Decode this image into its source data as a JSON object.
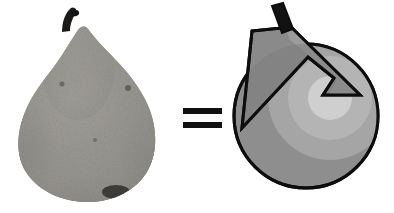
{
  "figure": {
    "title": "Pear equals geometric primitive decomposition",
    "background_color": "#ffffff",
    "width": 394,
    "height": 213
  },
  "panels": [
    {
      "id": "pear-photo",
      "role": "left-operand",
      "label": "Grayscale photograph of a pear",
      "subject": "pear",
      "rendering": "photographic-grayscale",
      "bounds": {
        "x": 0,
        "y": 0,
        "width": 175,
        "height": 213
      }
    },
    {
      "id": "equals-operator",
      "role": "operator",
      "label": "=",
      "glyph_name": "equals-sign",
      "bounds": {
        "x": 175,
        "y": 0,
        "width": 55,
        "height": 213
      }
    },
    {
      "id": "shape-decomposition",
      "role": "right-operand",
      "label": "Abstract shape decomposition of a pear",
      "rendering": "flat-vector-grayscale",
      "bounds": {
        "x": 230,
        "y": 0,
        "width": 164,
        "height": 213
      }
    }
  ],
  "colors": {
    "outline": "#0d0d0d",
    "stem_fill": "#121212",
    "body_mid_gray": "#8e8e8e",
    "body_dark_gray": "#7c7c7c",
    "body_light_gray": "#a5a5a5",
    "ring_light_gray": "#b4b4b4",
    "inner_circle_gray": "#cfcfcf",
    "triangle_gray": "#8a8a8a",
    "triangle_light_gray": "#9a9a9a",
    "pear_skin_mid": "#8f8d88",
    "pear_skin_light": "#b9b7b0",
    "pear_skin_dark": "#5d5b57",
    "pear_shadow": "#3b3a37",
    "background": "#ffffff"
  },
  "pear_photo": {
    "stem": {
      "label": "pear-stem",
      "color": "#1a1a1a"
    },
    "body": {
      "label": "pear-body",
      "center_x": 88,
      "center_y": 122,
      "radius_x": 70,
      "radius_y": 88
    },
    "neck": {
      "label": "pear-neck",
      "top_x": 78,
      "top_y": 28
    },
    "blemish": {
      "label": "pear-blemish",
      "x": 115,
      "y": 192
    }
  },
  "equals_sign": {
    "character": "=",
    "bar_count": 2,
    "bar_color": "#111111",
    "bar_width": 38,
    "bar_height": 6,
    "bar_gap": 8,
    "center_y": 118
  },
  "shape_decomposition": {
    "primitives": [
      {
        "name": "body-circle",
        "shape": "circle",
        "center": {
          "x": 76,
          "y": 116
        },
        "radius": 72,
        "fill": "#8e8e8e",
        "stroke": "#0d0d0d",
        "stroke_width": 3
      },
      {
        "name": "outer-ring-band",
        "shape": "annulus-sector",
        "fill": "#a5a5a5",
        "note": "lighter crescent band inside the body circle"
      },
      {
        "name": "mid-ring-band",
        "shape": "annulus-sector",
        "fill": "#b4b4b4",
        "note": "second lighter band nested within the crescent"
      },
      {
        "name": "inner-highlight-circle",
        "shape": "circle",
        "center": {
          "x": 100,
          "y": 98
        },
        "radius": 22,
        "fill": "#cfcfcf"
      },
      {
        "name": "neck-triangle",
        "shape": "polygon-with-notch",
        "fill": "#8a8a8a",
        "stroke": "#0d0d0d",
        "stroke_width": 3,
        "vertices": [
          {
            "x": 22,
            "y": 31
          },
          {
            "x": 61,
            "y": 27
          },
          {
            "x": 130,
            "y": 95
          },
          {
            "x": 93,
            "y": 95
          },
          {
            "x": 104,
            "y": 78
          },
          {
            "x": 78,
            "y": 57
          },
          {
            "x": 12,
            "y": 128
          }
        ],
        "note": "triangular neck wedge overlapping the body circle, with a chevron notch on its right side"
      },
      {
        "name": "stem-bar",
        "shape": "quadrilateral",
        "fill": "#121212",
        "stroke": "#0d0d0d",
        "vertices": [
          {
            "x": 42,
            "y": 7
          },
          {
            "x": 52,
            "y": 4
          },
          {
            "x": 62,
            "y": 28
          },
          {
            "x": 52,
            "y": 32
          }
        ]
      }
    ]
  }
}
